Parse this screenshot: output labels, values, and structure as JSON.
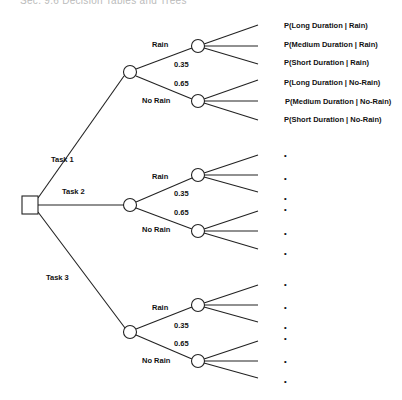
{
  "header": {
    "text": "Sec. 9.6   Decision Tables and Trees"
  },
  "decision_node": {
    "shape": "square"
  },
  "tasks": [
    {
      "label": "Task 1",
      "branches": [
        {
          "label": "Rain",
          "probability": "0.35",
          "outcomes": [
            "P(Long Duration | Rain)",
            "P(Medium Duration | Rain)",
            "P(Short Duration | Rain)"
          ]
        },
        {
          "label": "No Rain",
          "probability": "0.65",
          "outcomes": [
            "P(Long Duration | No-Rain)",
            "P(Medium Duration | No-Rain)",
            "P(Short Duration | No-Rain)"
          ]
        }
      ]
    },
    {
      "label": "Task 2",
      "branches": [
        {
          "label": "Rain",
          "probability": "0.35",
          "outcomes": [
            "•",
            "•",
            "•"
          ]
        },
        {
          "label": "No Rain",
          "probability": "0.65",
          "outcomes": [
            "•",
            "•",
            "•"
          ]
        }
      ]
    },
    {
      "label": "Task 3",
      "branches": [
        {
          "label": "Rain",
          "probability": "0.35",
          "outcomes": [
            "•",
            "•",
            "•"
          ]
        },
        {
          "label": "No Rain",
          "probability": "0.65",
          "outcomes": [
            "•",
            "•",
            "•"
          ]
        }
      ]
    }
  ]
}
